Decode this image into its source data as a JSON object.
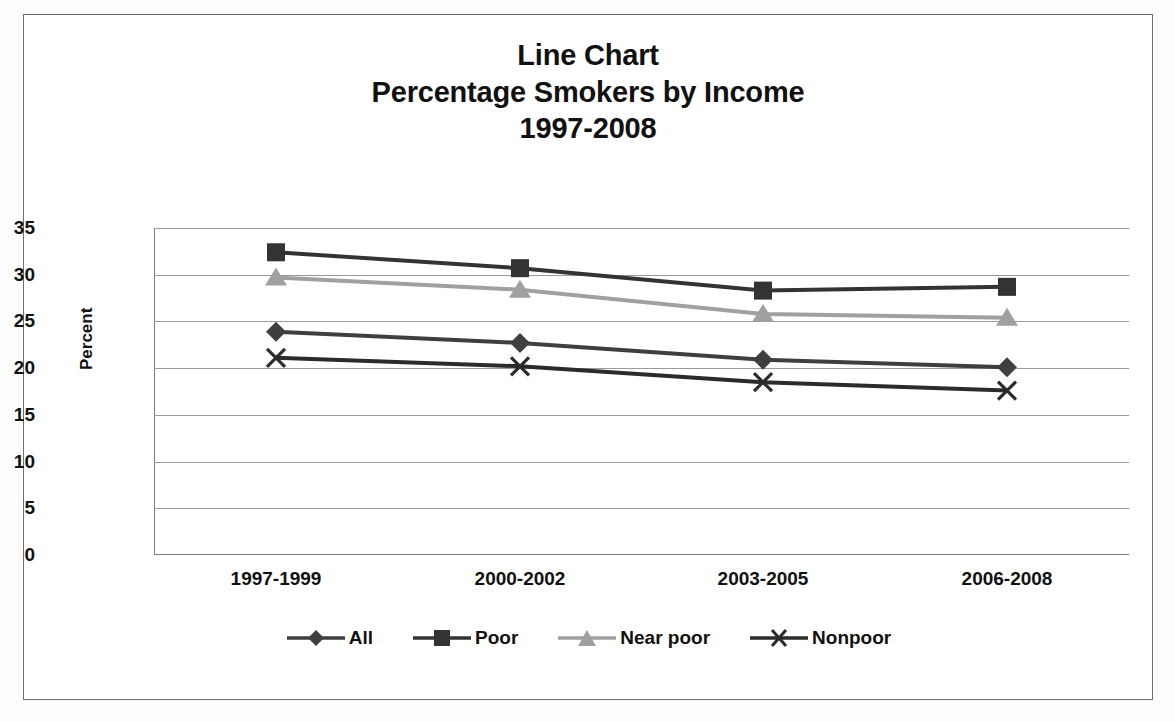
{
  "chart_data": {
    "type": "line",
    "title": "Line Chart\nPercentage Smokers by Income\n1997-2008",
    "title_lines": [
      "Line Chart",
      "Percentage Smokers by Income",
      "1997-2008"
    ],
    "xlabel": "",
    "ylabel": "Percent",
    "categories": [
      "1997-1999",
      "2000-2002",
      "2003-2005",
      "2006-2008"
    ],
    "ylim": [
      0,
      35
    ],
    "ytick_labels": [
      "0",
      "5",
      "10",
      "15",
      "20",
      "25",
      "30",
      "35"
    ],
    "ytick_values": [
      0,
      5,
      10,
      15,
      20,
      25,
      30,
      35
    ],
    "grid": true,
    "legend_position": "bottom",
    "series": [
      {
        "name": "All",
        "marker": "diamond",
        "color": "#3f3f3f",
        "values": [
          23.9,
          22.7,
          20.9,
          20.1
        ]
      },
      {
        "name": "Poor",
        "marker": "square",
        "color": "#333333",
        "values": [
          32.4,
          30.7,
          28.3,
          28.7
        ]
      },
      {
        "name": "Near poor",
        "marker": "triangle",
        "color": "#a0a0a0",
        "values": [
          29.7,
          28.4,
          25.8,
          25.4
        ]
      },
      {
        "name": "Nonpoor",
        "marker": "cross-x",
        "color": "#2b2b2b",
        "values": [
          21.1,
          20.2,
          18.5,
          17.6
        ]
      }
    ]
  },
  "colors": {
    "frame": "#6e6e6e",
    "gridline": "#9a9a9a",
    "text": "#111111",
    "background": "#ffffff"
  }
}
